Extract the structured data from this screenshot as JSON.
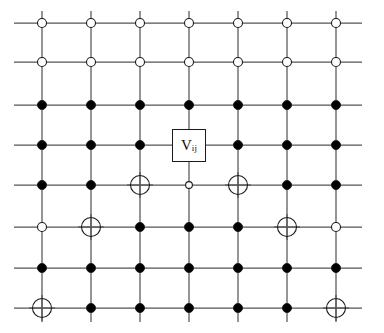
{
  "figure": {
    "name": "lattice-diagram",
    "type": "square-lattice-graph",
    "background_color": "#ffffff",
    "line_color": "#555555",
    "node_stroke_color": "#1a1a1a",
    "node_fill_color": "#000000",
    "open_node_fill_color": "#ffffff"
  },
  "geometry": {
    "width": 384,
    "height": 333,
    "columns_x": [
      42,
      91,
      140,
      189,
      238,
      287,
      336
    ],
    "rows_y": [
      23,
      62,
      105,
      145,
      185,
      227,
      268,
      308
    ],
    "line_overhang_left": 28,
    "line_overhang_right": 26,
    "line_overhang_top": 12,
    "line_overhang_bottom": 14,
    "filled_radius": 4.5,
    "open_radius": 4.5,
    "small_open_radius": 3.4,
    "crossed_radius": 9.5,
    "cross_arm": 13
  },
  "node_legend": [
    {
      "key": "filled",
      "label": "filled circle"
    },
    {
      "key": "open",
      "label": "open circle"
    },
    {
      "key": "small_open",
      "label": "small open circle"
    },
    {
      "key": "crossed",
      "label": "crossed circle"
    },
    {
      "key": "label",
      "label": "labelled box node"
    }
  ],
  "nodes": [
    {
      "row": 0,
      "types": [
        "open",
        "open",
        "open",
        "open",
        "open",
        "open",
        "open"
      ]
    },
    {
      "row": 1,
      "types": [
        "open",
        "open",
        "open",
        "open",
        "open",
        "open",
        "open"
      ]
    },
    {
      "row": 2,
      "types": [
        "filled",
        "filled",
        "filled",
        "filled",
        "filled",
        "filled",
        "filled"
      ]
    },
    {
      "row": 3,
      "types": [
        "filled",
        "filled",
        "filled",
        "label",
        "filled",
        "filled",
        "filled"
      ]
    },
    {
      "row": 4,
      "types": [
        "filled",
        "filled",
        "crossed",
        "small_open",
        "crossed",
        "filled",
        "filled"
      ]
    },
    {
      "row": 5,
      "types": [
        "open",
        "crossed",
        "filled",
        "filled",
        "filled",
        "crossed",
        "open"
      ]
    },
    {
      "row": 6,
      "types": [
        "filled",
        "filled",
        "filled",
        "filled",
        "filled",
        "filled",
        "filled"
      ]
    },
    {
      "row": 7,
      "types": [
        "crossed",
        "filled",
        "filled",
        "filled",
        "filled",
        "filled",
        "crossed"
      ]
    }
  ],
  "label_node": {
    "row": 3,
    "column": 3,
    "variable": "V",
    "subscript": "ij",
    "box_width": 34,
    "box_height": 33
  },
  "chart_data": {
    "type": "diagram",
    "title": "",
    "columns": 7,
    "rows": 8,
    "categories": [
      "col1",
      "col2",
      "col3",
      "col4",
      "col5",
      "col6",
      "col7"
    ],
    "series": [
      {
        "name": "row1",
        "values": [
          "open",
          "open",
          "open",
          "open",
          "open",
          "open",
          "open"
        ]
      },
      {
        "name": "row2",
        "values": [
          "open",
          "open",
          "open",
          "open",
          "open",
          "open",
          "open"
        ]
      },
      {
        "name": "row3",
        "values": [
          "filled",
          "filled",
          "filled",
          "filled",
          "filled",
          "filled",
          "filled"
        ]
      },
      {
        "name": "row4",
        "values": [
          "filled",
          "filled",
          "filled",
          "label",
          "filled",
          "filled",
          "filled"
        ]
      },
      {
        "name": "row5",
        "values": [
          "filled",
          "filled",
          "crossed",
          "small_open",
          "crossed",
          "filled",
          "filled"
        ]
      },
      {
        "name": "row6",
        "values": [
          "open",
          "crossed",
          "filled",
          "filled",
          "filled",
          "crossed",
          "open"
        ]
      },
      {
        "name": "row7",
        "values": [
          "filled",
          "filled",
          "filled",
          "filled",
          "filled",
          "filled",
          "filled"
        ]
      },
      {
        "name": "row8",
        "values": [
          "crossed",
          "filled",
          "filled",
          "filled",
          "filled",
          "filled",
          "crossed"
        ]
      }
    ],
    "annotations": [
      {
        "text": "V",
        "subscript": "ij",
        "at_column": 4,
        "at_row": 4
      }
    ],
    "legend_position": "none",
    "grid": true,
    "xlabel": "",
    "ylabel": ""
  }
}
